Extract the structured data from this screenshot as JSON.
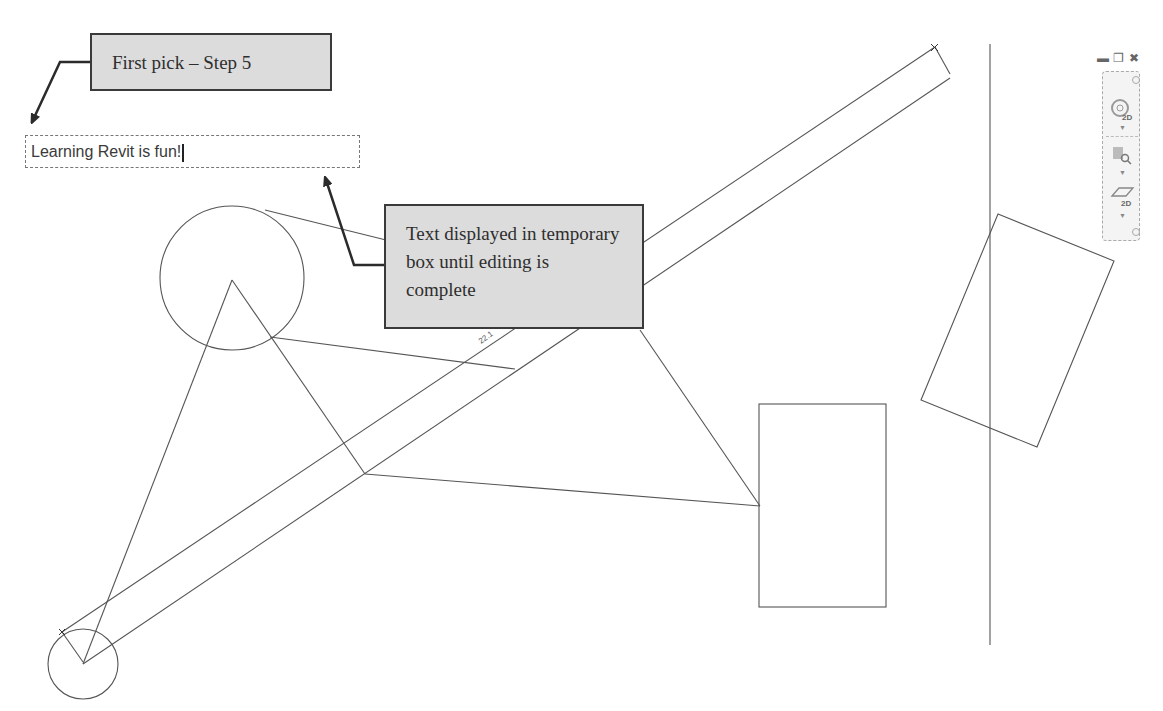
{
  "annotations": {
    "callout_first_pick": "First pick – Step 5",
    "callout_temp_box": "Text displayed in temporary box until editing is complete"
  },
  "text_editor": {
    "value": "Learning Revit is fun!"
  },
  "dimension": {
    "label": "22.1"
  },
  "window_controls": {
    "minimize": "minimize",
    "restore": "restore",
    "close": "close"
  },
  "navigation_bar": {
    "items": [
      {
        "name": "2d-wheel",
        "label": "2D"
      },
      {
        "name": "zoom",
        "label": ""
      },
      {
        "name": "pan-2d",
        "label": "2D"
      }
    ]
  },
  "colors": {
    "line": "#555555",
    "callout_fill": "#dcdcdc",
    "callout_border": "#3a3a3a",
    "arrow": "#2b2b2b"
  }
}
